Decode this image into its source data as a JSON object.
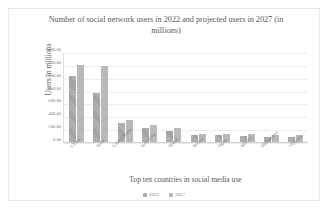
{
  "chart_data": {
    "type": "bar",
    "title": "Number of social network users in 2022 and projected users in 2027 (in millions)",
    "xlabel": "Top ten countries in social media use",
    "ylabel": "Users in millions",
    "categories": [
      "China",
      "India",
      "United States",
      "Indonesia",
      "Brazil",
      "Russia",
      "Japan",
      "Mexico",
      "Philippines",
      "Vietnam"
    ],
    "series": [
      {
        "name": "2022",
        "values": [
          1021.96,
          755.47,
          302.25,
          217.53,
          165.54,
          106.0,
          102.0,
          94.0,
          84.0,
          76.0
        ]
      },
      {
        "name": "2027",
        "values": [
          1205.0,
          1180.0,
          335.0,
          262.0,
          213.0,
          130.0,
          118.0,
          120.0,
          111.0,
          103.0
        ]
      }
    ],
    "ylim": [
      0,
      1400
    ],
    "yticks": [
      "1,400.00",
      "1,200.00",
      "1,000.00",
      "800.00",
      "600.00",
      "400.00",
      "200.00",
      "0.00"
    ],
    "grid": true,
    "legend_position": "bottom",
    "colors": {
      "series_2022": "#9a9a9a",
      "series_2027": "#b9b9b9",
      "grid": "#ededed",
      "text": "#7d7d7d"
    }
  }
}
